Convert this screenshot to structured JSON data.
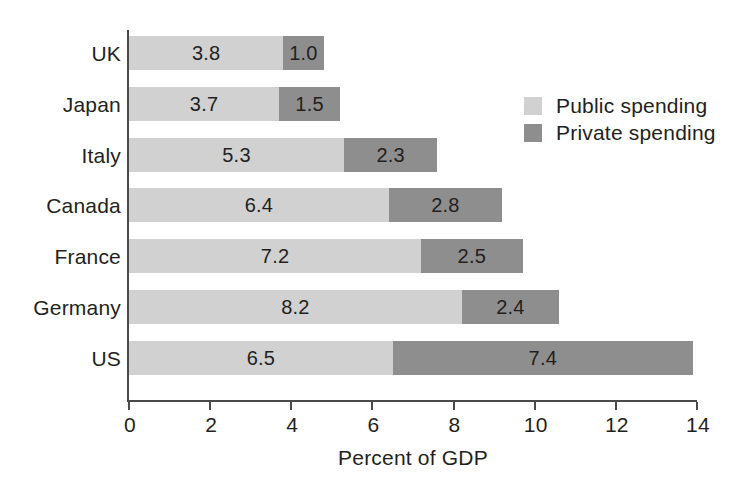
{
  "chart_data": {
    "type": "bar",
    "orientation": "horizontal",
    "stacked": true,
    "title": "",
    "xlabel": "Percent of GDP",
    "ylabel": "",
    "xlim": [
      0,
      14
    ],
    "xticks": [
      0,
      2,
      4,
      6,
      8,
      10,
      12,
      14
    ],
    "xtick_labels": [
      "0",
      "2",
      "4",
      "6",
      "8",
      "10",
      "12",
      "14"
    ],
    "grid": false,
    "legend_position": "upper right",
    "categories": [
      "UK",
      "Japan",
      "Italy",
      "Canada",
      "France",
      "Germany",
      "US"
    ],
    "series": [
      {
        "name": "Public spending",
        "color": "#d1d1d1",
        "values": [
          3.8,
          3.7,
          5.3,
          6.4,
          7.2,
          8.2,
          6.5
        ],
        "labels": [
          "3.8",
          "3.7",
          "5.3",
          "6.4",
          "7.2",
          "8.2",
          "6.5"
        ]
      },
      {
        "name": "Private spending",
        "color": "#8e8e8e",
        "values": [
          1.0,
          1.5,
          2.3,
          2.8,
          2.5,
          2.4,
          7.4
        ],
        "labels": [
          "1.0",
          "1.5",
          "2.3",
          "2.8",
          "2.5",
          "2.4",
          "7.4"
        ]
      }
    ],
    "totals": [
      4.8,
      5.2,
      7.6,
      9.2,
      9.7,
      10.6,
      13.9
    ]
  },
  "legend": {
    "items": [
      {
        "label": "Public spending",
        "color": "#d1d1d1"
      },
      {
        "label": "Private spending",
        "color": "#8e8e8e"
      }
    ]
  },
  "axis": {
    "x_title": "Percent of GDP"
  },
  "colors": {
    "public": "#d1d1d1",
    "private": "#8e8e8e",
    "axis": "#4a4a4a",
    "text": "#231f20",
    "background": "#ffffff"
  }
}
